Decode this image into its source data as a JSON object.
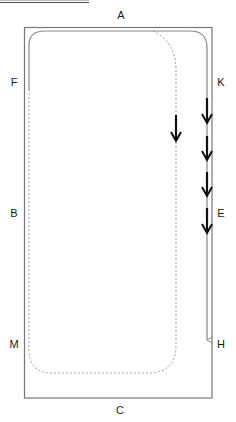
{
  "diagram": {
    "type": "track-layout",
    "labels": [
      {
        "id": "A",
        "text": "A",
        "x": 121,
        "y": 15
      },
      {
        "id": "F",
        "text": "F",
        "x": 14,
        "y": 82
      },
      {
        "id": "K",
        "text": "K",
        "x": 221,
        "y": 82
      },
      {
        "id": "B",
        "text": "B",
        "x": 14,
        "y": 213
      },
      {
        "id": "E",
        "text": "E",
        "x": 221,
        "y": 213
      },
      {
        "id": "M",
        "text": "M",
        "x": 14,
        "y": 344
      },
      {
        "id": "H",
        "text": "H",
        "x": 221,
        "y": 344
      },
      {
        "id": "C",
        "text": "C",
        "x": 120,
        "y": 410
      }
    ],
    "outer_frame": {
      "x": 24,
      "y": 27,
      "width": 188,
      "height": 371,
      "stroke": "#777777"
    },
    "solid_path": {
      "description": "Solid inner route from left (near F) over top (A) and down right side (K to H)",
      "stroke": "#888888",
      "end_arrow": "thin"
    },
    "dashed_path": {
      "description": "Dotted route branching from top, down right-inner side, across bottom (C), up left side (M, B)",
      "stroke": "#999999"
    },
    "bold_arrows": [
      {
        "path": "dashed",
        "x": 176,
        "y1": 115,
        "y2": 141,
        "direction": "down"
      },
      {
        "path": "solid-right",
        "x": 207,
        "y1": 98,
        "y2": 123,
        "direction": "down"
      },
      {
        "path": "solid-right",
        "x": 207,
        "y1": 136,
        "y2": 160,
        "direction": "down"
      },
      {
        "path": "solid-right",
        "x": 207,
        "y1": 172,
        "y2": 196,
        "direction": "down"
      },
      {
        "path": "solid-right",
        "x": 207,
        "y1": 208,
        "y2": 233,
        "direction": "down"
      }
    ],
    "arrow_color": "#111111"
  }
}
